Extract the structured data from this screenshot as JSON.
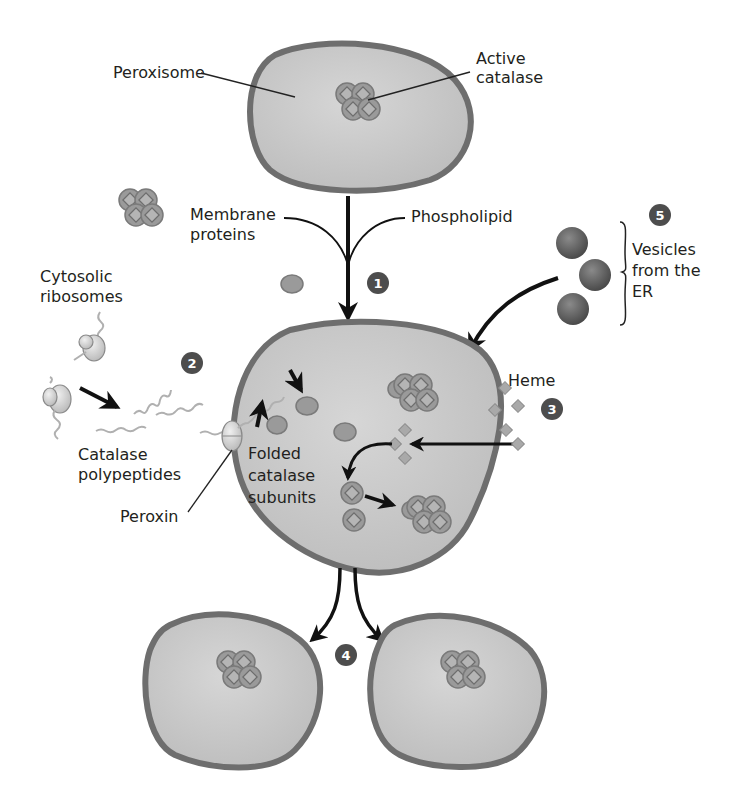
{
  "colors": {
    "membrane": "#6e6e6e",
    "lumen": "#c9c9c9",
    "subunit": "#9a9a9a",
    "heme": "#a9a9a9",
    "vesicle": "#5a5a5a",
    "step_badge": "#4d4d4d",
    "polypeptide": "#b0b0b0",
    "arrow": "#111111"
  },
  "labels": {
    "peroxisome": "Peroxisome",
    "active_catalase_1": "Active",
    "active_catalase_2": "catalase",
    "membrane_proteins_1": "Membrane",
    "membrane_proteins_2": "proteins",
    "phospholipid": "Phospholipid",
    "cytosolic_ribosomes_1": "Cytosolic",
    "cytosolic_ribosomes_2": "ribosomes",
    "catalase_polypeptides_1": "Catalase",
    "catalase_polypeptides_2": "polypeptides",
    "peroxin": "Peroxin",
    "folded_subunits_1": "Folded",
    "folded_subunits_2": "catalase",
    "folded_subunits_3": "subunits",
    "heme": "Heme",
    "vesicles_1": "Vesicles",
    "vesicles_2": "from the",
    "vesicles_3": "ER"
  },
  "steps": [
    "1",
    "2",
    "3",
    "4",
    "5"
  ]
}
